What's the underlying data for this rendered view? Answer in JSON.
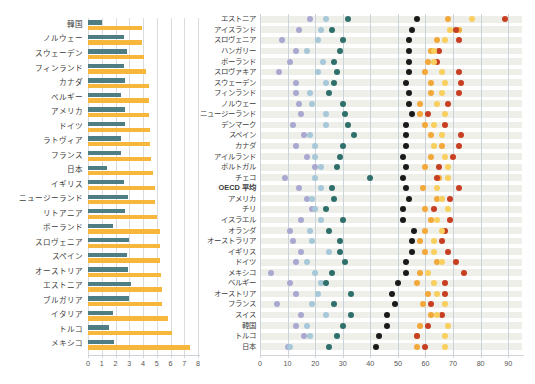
{
  "figure": {
    "background_color": "#ffffff",
    "panels": [
      "bar-chart-left",
      "dot-plot-right"
    ]
  },
  "chart_data": [
    {
      "id": "left-bar-chart",
      "type": "bar",
      "orientation": "horizontal",
      "title": "",
      "xlabel": "",
      "ylabel": "",
      "xlim": [
        0,
        8
      ],
      "xticks": [
        0,
        1,
        2,
        3,
        4,
        5,
        6,
        7,
        8
      ],
      "xticklabels": [
        "0",
        "1",
        "2",
        "3",
        "4",
        "5",
        "6",
        "7",
        "8"
      ],
      "grid": true,
      "legend": "none",
      "colors": {
        "series1": "#4e7e83",
        "series2": "#f6b73c"
      },
      "categories": [
        "韓国",
        "ノルウェー",
        "スウェーデン",
        "フィンランド",
        "カナダ",
        "ベルギー",
        "アメリカ",
        "ドイツ",
        "ラトヴィア",
        "フランス",
        "日本",
        "イギリス",
        "ニュージーランド",
        "リトアニア",
        "ポーランド",
        "スロヴェニア",
        "スペイン",
        "オーストリア",
        "エストニア",
        "ブルガリア",
        "イタリア",
        "トルコ",
        "メキシコ"
      ],
      "series": [
        {
          "name": "series-teal",
          "color": "#4e7e83",
          "values": [
            1.0,
            2.6,
            2.8,
            2.6,
            2.7,
            2.4,
            2.7,
            2.7,
            2.4,
            2.4,
            1.4,
            2.6,
            2.9,
            2.7,
            1.8,
            3.0,
            2.8,
            2.9,
            3.1,
            3.0,
            1.8,
            1.5,
            1.9
          ]
        },
        {
          "name": "series-amber",
          "color": "#f6b73c",
          "values": [
            3.9,
            3.9,
            4.1,
            4.2,
            4.4,
            4.4,
            4.4,
            4.5,
            4.5,
            4.6,
            4.7,
            4.9,
            4.9,
            5.0,
            5.2,
            5.2,
            5.2,
            5.3,
            5.4,
            5.4,
            5.8,
            6.1,
            7.4
          ]
        }
      ]
    },
    {
      "id": "right-dot-plot",
      "type": "scatter",
      "orientation": "horizontal",
      "title": "",
      "xlabel": "",
      "ylabel": "",
      "xlim": [
        0,
        95
      ],
      "xticks": [
        0,
        10,
        20,
        30,
        40,
        50,
        60,
        70,
        80,
        90
      ],
      "xticklabels": [
        "0",
        "10",
        "20",
        "30",
        "40",
        "50",
        "60",
        "70",
        "80",
        "90"
      ],
      "grid": true,
      "legend": "none",
      "row_band_color": "#efefe9",
      "colors": {
        "s1_light_purple": "#a9a8d0",
        "s2_light_blue": "#a7c8d8",
        "s3_teal": "#2f6f6b",
        "s4_black": "#1a1a1a",
        "s5_orange": "#f3a83a",
        "s6_red": "#c63f22",
        "s7_light_orange": "#f9cf5e"
      },
      "categories": [
        "エストニア",
        "アイスランド",
        "スロヴェニア",
        "ハンガリー",
        "ポーランド",
        "スロヴァキア",
        "スウェーデン",
        "フィンランド",
        "ノルウェー",
        "ニュージーランド",
        "デンマーク",
        "スペイン",
        "カナダ",
        "アイルランド",
        "ポルトガル",
        "チェコ",
        "OECD 平均",
        "アメリカ",
        "チリ",
        "イスラエル",
        "オランダ",
        "オーストラリア",
        "イギリス",
        "ドイツ",
        "メキシコ",
        "ベルギー",
        "オーストリア",
        "フランス",
        "スイス",
        "韓国",
        "トルコ",
        "日本"
      ],
      "series": [
        {
          "name": "s1-light-purple",
          "color": "#a9a8d0",
          "values": [
            18,
            14,
            8,
            13,
            11,
            7,
            13,
            13,
            14,
            15,
            12,
            16,
            13,
            17,
            20,
            9,
            14,
            17,
            19,
            15,
            11,
            12,
            15,
            13,
            4,
            11,
            13,
            6,
            15,
            13,
            16,
            10
          ]
        },
        {
          "name": "s2-light-blue",
          "color": "#a7c8d8",
          "values": [
            24,
            22,
            21,
            17,
            23,
            21,
            24,
            18,
            19,
            24,
            24,
            18,
            20,
            20,
            22,
            20,
            22,
            19,
            20,
            22,
            18,
            19,
            25,
            17,
            20,
            22,
            21,
            19,
            24,
            17,
            18,
            11
          ]
        },
        {
          "name": "s3-teal",
          "color": "#2f6f6b",
          "values": [
            32,
            26,
            30,
            29,
            27,
            28,
            27,
            25,
            30,
            31,
            32,
            34,
            30,
            29,
            28,
            40,
            26,
            27,
            24,
            30,
            25,
            29,
            29,
            31,
            26,
            24,
            33,
            27,
            33,
            30,
            28,
            25
          ]
        },
        {
          "name": "s4-black",
          "color": "#1a1a1a",
          "values": [
            57,
            55,
            54,
            54,
            54,
            54,
            53,
            54,
            54,
            55,
            53,
            53,
            53,
            52,
            53,
            52,
            53,
            54,
            52,
            52,
            56,
            55,
            55,
            53,
            53,
            50,
            48,
            49,
            46,
            46,
            43,
            42
          ]
        },
        {
          "name": "s5-orange",
          "color": "#f3a83a",
          "values": [
            68,
            72,
            64,
            62,
            61,
            60,
            62,
            62,
            58,
            58,
            60,
            62,
            66,
            62,
            60,
            65,
            59,
            64,
            60,
            62,
            60,
            58,
            60,
            64,
            58,
            57,
            61,
            59,
            62,
            58,
            57,
            57
          ]
        },
        {
          "name": "s6-red",
          "color": "#c63f22",
          "values": [
            89,
            71,
            72,
            65,
            64,
            72,
            73,
            72,
            68,
            61,
            67,
            73,
            72,
            70,
            65,
            64,
            72,
            69,
            63,
            69,
            67,
            66,
            68,
            71,
            74,
            67,
            67,
            62,
            66,
            61,
            57,
            60
          ]
        },
        {
          "name": "s7-light-orange",
          "color": "#f9cf5e",
          "values": [
            77,
            69,
            67,
            63,
            63,
            66,
            67,
            66,
            64,
            67,
            63,
            66,
            63,
            67,
            68,
            68,
            64,
            66,
            68,
            64,
            66,
            63,
            63,
            66,
            61,
            63,
            64,
            67,
            64,
            68,
            67,
            67
          ]
        }
      ]
    }
  ]
}
